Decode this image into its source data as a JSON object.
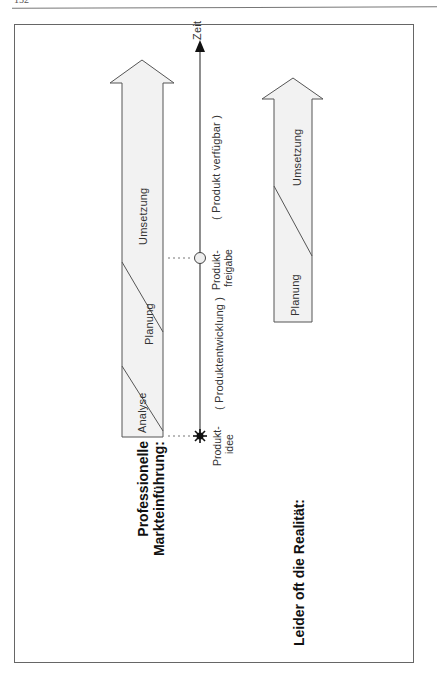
{
  "page": {
    "number": "152"
  },
  "diagram": {
    "professional": {
      "title_line1": "Professionelle",
      "title_line2": "Markteinführung:",
      "arrow_segments": [
        "Analyse",
        "Planung",
        "Umsetzung"
      ]
    },
    "timeline": {
      "axis_label": "Zeit",
      "start_label_line1": "Produkt-",
      "start_label_line2": "idee",
      "milestone_label_line1": "Produkt-",
      "milestone_label_line2": "freigabe",
      "phase1_label": "( Produktentwicklung )",
      "phase2_label": "( Produkt verfügbar )"
    },
    "reality": {
      "title": "Leider oft die Realität:",
      "arrow_segments": [
        "Planung",
        "Umsetzung"
      ]
    },
    "colors": {
      "arrow_fill": "#f2f2f2",
      "stroke": "#555555",
      "text": "#222222"
    }
  }
}
